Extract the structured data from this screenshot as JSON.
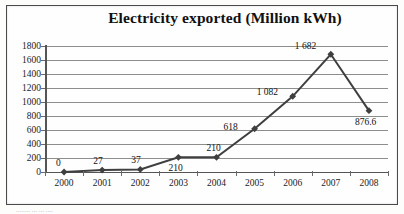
{
  "chart_data": {
    "type": "line",
    "title": "Electricity exported (Million kWh)",
    "xlabel": "",
    "ylabel": "",
    "categories": [
      "2000",
      "2001",
      "2002",
      "2003",
      "2004",
      "2005",
      "2006",
      "2007",
      "2008"
    ],
    "values": [
      0,
      27,
      37,
      210,
      210,
      618,
      1082,
      1682,
      876.6
    ],
    "point_labels": [
      "0",
      "27",
      "37",
      "210",
      "210",
      "618",
      "1 082",
      "1 682",
      "876.6"
    ],
    "ylim": [
      0,
      1800
    ],
    "ytick_step": 200,
    "yticks": [
      "0",
      "200",
      "400",
      "600",
      "800",
      "1000",
      "1200",
      "1400",
      "1600",
      "1800"
    ],
    "grid": true,
    "legend": false,
    "series_color": "#3f3f3f",
    "grid_color": "#8d8d8d",
    "axis_color": "#555555",
    "marker": "diamond"
  },
  "footer": {
    "smudge_text": "........ ... ... ...."
  }
}
